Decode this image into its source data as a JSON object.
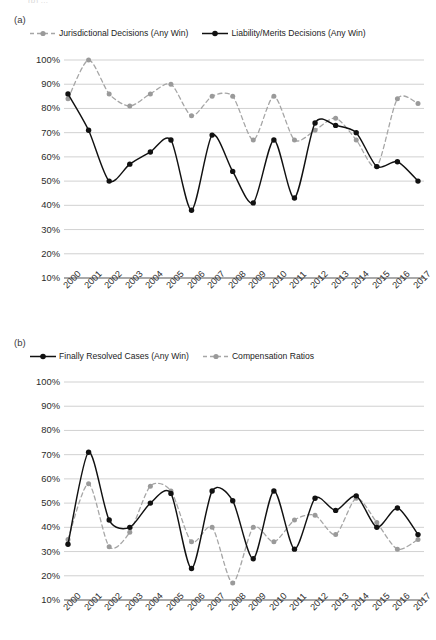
{
  "top_cut_text": "(b) ...",
  "panels": [
    {
      "id": "a",
      "label": "(a)",
      "legend": [
        {
          "name": "Jurisdictional Decisions (Any Win)",
          "style": "dashed-gray",
          "color": "#a6a6a6"
        },
        {
          "name": "Liability/Merits Decisions (Any Win)",
          "style": "solid-black",
          "color": "#111111"
        }
      ]
    },
    {
      "id": "b",
      "label": "(b)",
      "legend": [
        {
          "name": "Finally Resolved Cases (Any Win)",
          "style": "solid-black",
          "color": "#111111"
        },
        {
          "name": "Compensation Ratios",
          "style": "dashed-gray",
          "color": "#a6a6a6"
        }
      ]
    }
  ],
  "chart_data": [
    {
      "type": "line",
      "panel": "a",
      "title": "",
      "xlabel": "",
      "ylabel": "",
      "grid": true,
      "legend_position": "top",
      "ylim": [
        10,
        100
      ],
      "yticks": [
        100,
        90,
        80,
        70,
        60,
        50,
        40,
        30,
        20,
        10
      ],
      "ytick_labels": [
        "100%",
        "90%",
        "80%",
        "70%",
        "60%",
        "50%",
        "40%",
        "30%",
        "20%",
        "10%"
      ],
      "categories": [
        "2000",
        "2001",
        "2002",
        "2003",
        "2004",
        "2005",
        "2006",
        "2007",
        "2008",
        "2009",
        "2010",
        "2011",
        "2012",
        "2013",
        "2014",
        "2015",
        "2016",
        "2017"
      ],
      "series": [
        {
          "name": "Jurisdictional Decisions (Any Win)",
          "style": "dashed",
          "color": "#a6a6a6",
          "values": [
            84,
            100,
            86,
            81,
            86,
            90,
            77,
            85,
            85,
            67,
            85,
            67,
            71,
            76,
            67,
            56,
            84,
            82
          ]
        },
        {
          "name": "Liability/Merits Decisions (Any Win)",
          "style": "solid",
          "color": "#111111",
          "values": [
            86,
            71,
            50,
            57,
            62,
            67,
            38,
            69,
            54,
            41,
            67,
            43,
            74,
            73,
            70,
            56,
            58,
            50
          ]
        }
      ]
    },
    {
      "type": "line",
      "panel": "b",
      "title": "",
      "xlabel": "",
      "ylabel": "",
      "grid": true,
      "legend_position": "top",
      "ylim": [
        10,
        100
      ],
      "yticks": [
        100,
        90,
        80,
        70,
        60,
        50,
        40,
        30,
        20,
        10
      ],
      "ytick_labels": [
        "100%",
        "90%",
        "80%",
        "70%",
        "60%",
        "50%",
        "40%",
        "30%",
        "20%",
        "10%"
      ],
      "categories": [
        "2000",
        "2001",
        "2002",
        "2003",
        "2004",
        "2005",
        "2006",
        "2007",
        "2008",
        "2009",
        "2010",
        "2011",
        "2012",
        "2013",
        "2014",
        "2015",
        "2016",
        "2017"
      ],
      "series": [
        {
          "name": "Finally Resolved Cases (Any Win)",
          "style": "solid",
          "color": "#111111",
          "values": [
            33,
            71,
            43,
            40,
            50,
            54,
            23,
            55,
            51,
            27,
            55,
            31,
            52,
            47,
            53,
            40,
            48,
            37
          ]
        },
        {
          "name": "Compensation Ratios",
          "style": "dashed",
          "color": "#a6a6a6",
          "values": [
            35,
            58,
            32,
            38,
            57,
            55,
            34,
            40,
            17,
            40,
            34,
            43,
            45,
            37,
            52,
            42,
            31,
            35
          ]
        }
      ]
    }
  ]
}
